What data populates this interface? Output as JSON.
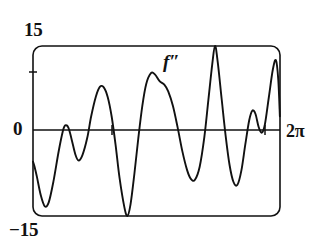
{
  "figure": {
    "kind": "function-plot",
    "background_color": "#ffffff",
    "stroke_color": "#111111",
    "labels": {
      "y_max": "15",
      "y_min": "−15",
      "y_zero": "0",
      "x_max": "2π",
      "curve": "f″"
    }
  },
  "chart_data": {
    "type": "line",
    "title": "",
    "subtitle": "",
    "xlabel": "",
    "ylabel": "",
    "series_label": "f″",
    "xlim": [
      0,
      6.2832
    ],
    "ylim": [
      -15,
      15
    ],
    "xtick_labels": [
      "",
      "2π"
    ],
    "xticks": [
      0,
      6.2832
    ],
    "ytick_labels": [
      "15",
      "0",
      "−15"
    ],
    "yticks": [
      15,
      0,
      -15
    ],
    "grid": false,
    "legend": "none",
    "axis_tick_marks_x": [
      2.05,
      5.9
    ],
    "axis_tick_marks_y": [
      7.5
    ],
    "annotations": [
      {
        "text": "f″",
        "x": 3.4,
        "y": 11.2
      }
    ],
    "points": [
      [
        0.0,
        -5.4
      ],
      [
        0.04,
        -6.3
      ],
      [
        0.1,
        -8.1
      ],
      [
        0.2,
        -11.4
      ],
      [
        0.3,
        -13.3
      ],
      [
        0.4,
        -12.6
      ],
      [
        0.52,
        -8.9
      ],
      [
        0.65,
        -3.7
      ],
      [
        0.76,
        0.0
      ],
      [
        0.82,
        1.0
      ],
      [
        0.9,
        0.6
      ],
      [
        0.98,
        -1.4
      ],
      [
        1.08,
        -4.2
      ],
      [
        1.16,
        -5.2
      ],
      [
        1.26,
        -4.2
      ],
      [
        1.38,
        -1.2
      ],
      [
        1.48,
        2.6
      ],
      [
        1.6,
        6.1
      ],
      [
        1.7,
        7.8
      ],
      [
        1.8,
        7.7
      ],
      [
        1.9,
        6.0
      ],
      [
        2.0,
        2.6
      ],
      [
        2.1,
        -2.4
      ],
      [
        2.2,
        -8.2
      ],
      [
        2.32,
        -13.3
      ],
      [
        2.4,
        -15.0
      ],
      [
        2.48,
        -13.0
      ],
      [
        2.58,
        -7.5
      ],
      [
        2.68,
        -1.2
      ],
      [
        2.78,
        4.4
      ],
      [
        2.88,
        8.3
      ],
      [
        3.0,
        10.2
      ],
      [
        3.1,
        10.0
      ],
      [
        3.22,
        8.8
      ],
      [
        3.34,
        8.2
      ],
      [
        3.44,
        7.0
      ],
      [
        3.56,
        4.4
      ],
      [
        3.68,
        0.6
      ],
      [
        3.8,
        -3.6
      ],
      [
        3.92,
        -6.9
      ],
      [
        4.02,
        -8.5
      ],
      [
        4.12,
        -8.6
      ],
      [
        4.24,
        -6.3
      ],
      [
        4.36,
        -1.0
      ],
      [
        4.46,
        5.4
      ],
      [
        4.56,
        11.8
      ],
      [
        4.63,
        15.0
      ],
      [
        4.7,
        12.1
      ],
      [
        4.8,
        5.6
      ],
      [
        4.9,
        -0.8
      ],
      [
        5.0,
        -6.0
      ],
      [
        5.1,
        -9.0
      ],
      [
        5.2,
        -9.5
      ],
      [
        5.3,
        -7.0
      ],
      [
        5.4,
        -2.4
      ],
      [
        5.5,
        1.9
      ],
      [
        5.58,
        3.6
      ],
      [
        5.66,
        3.0
      ],
      [
        5.74,
        0.7
      ],
      [
        5.82,
        -0.3
      ],
      [
        5.9,
        1.2
      ],
      [
        6.0,
        6.0
      ],
      [
        6.1,
        10.8
      ],
      [
        6.18,
        12.5
      ],
      [
        6.24,
        9.0
      ],
      [
        6.28,
        2.6
      ]
    ]
  }
}
